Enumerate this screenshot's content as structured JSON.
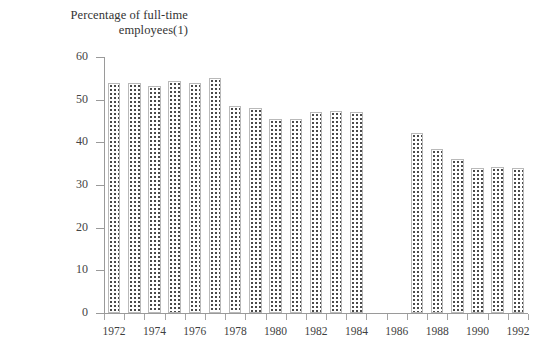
{
  "chart_data": {
    "type": "bar",
    "title": "Percentage of full-time\nemployees(1)",
    "xlabel": "",
    "ylabel": "",
    "ylim": [
      0,
      60
    ],
    "ytick_values": [
      0,
      10,
      20,
      30,
      40,
      50,
      60
    ],
    "ytick_labels": [
      "0",
      "10",
      "20",
      "30",
      "40",
      "50",
      "60"
    ],
    "grid": false,
    "legend": null,
    "categories": [
      "1972",
      "1973",
      "1974",
      "1975",
      "1976",
      "1977",
      "1978",
      "1979",
      "1980",
      "1981",
      "1982",
      "1983",
      "1984",
      "1985",
      "1986",
      "1987",
      "1988",
      "1989",
      "1990",
      "1991",
      "1992"
    ],
    "xtick_labels_shown": [
      "1972",
      "1974",
      "1976",
      "1978",
      "1980",
      "1982",
      "1984",
      "1986",
      "1988",
      "1990",
      "1992"
    ],
    "values": [
      54.0,
      53.8,
      53.3,
      54.3,
      54.0,
      55.0,
      48.6,
      48.0,
      45.4,
      45.5,
      47.0,
      47.4,
      47.0,
      null,
      null,
      42.2,
      38.5,
      36.0,
      34.0,
      34.2,
      34.0
    ],
    "missing_years": [
      "1985",
      "1986"
    ],
    "bar_fill": "dotted-stipple",
    "bar_edge_color": "#b9b9b9",
    "axis_color": "#9a9a9a",
    "text_color": "#3a3a3a",
    "background_color": "#ffffff"
  }
}
